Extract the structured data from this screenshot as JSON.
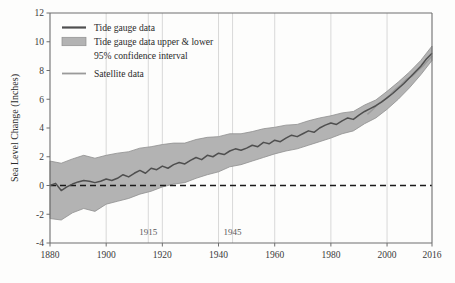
{
  "chart_data": {
    "type": "line",
    "title": "",
    "subtitle": "",
    "xlabel": "",
    "ylabel": "Sea Level Change (Inches)",
    "xlim": [
      1880,
      2016
    ],
    "ylim": [
      -4,
      12
    ],
    "grid": "vertical-only",
    "x_ticks": [
      "1880",
      "1900",
      "1920",
      "1940",
      "1960",
      "1980",
      "2000",
      "2016"
    ],
    "x_tick_values": [
      1880,
      1900,
      1920,
      1940,
      1960,
      1980,
      2000,
      2016
    ],
    "y_ticks": [
      "-4",
      "-2",
      "0",
      "2",
      "4",
      "6",
      "8",
      "10",
      "12"
    ],
    "y_tick_values": [
      -4,
      -2,
      0,
      2,
      4,
      6,
      8,
      10,
      12
    ],
    "inner_gridline_labels": [
      "1915",
      "1945"
    ],
    "inner_gridline_values": [
      1915,
      1945
    ],
    "zero_reference_line": 0,
    "legend_position": "top-left-inside",
    "legend": [
      {
        "label": "Tide gauge data",
        "marker": "line",
        "color": "#4f4f4f"
      },
      {
        "label": "Tide gauge data upper & lower",
        "marker": "band",
        "color": "#b3b3b3"
      },
      {
        "label": "95% confidence interval",
        "marker": "none",
        "color": "#b3b3b3"
      },
      {
        "label": "Satellite data",
        "marker": "line",
        "color": "#9a9a9a"
      }
    ],
    "series": [
      {
        "name": "Tide gauge data",
        "x": [
          1880,
          1882,
          1884,
          1886,
          1888,
          1890,
          1892,
          1894,
          1896,
          1898,
          1900,
          1902,
          1904,
          1906,
          1908,
          1910,
          1912,
          1914,
          1916,
          1918,
          1920,
          1922,
          1924,
          1926,
          1928,
          1930,
          1932,
          1934,
          1936,
          1938,
          1940,
          1942,
          1944,
          1946,
          1948,
          1950,
          1952,
          1954,
          1956,
          1958,
          1960,
          1962,
          1964,
          1966,
          1968,
          1970,
          1972,
          1974,
          1976,
          1978,
          1980,
          1982,
          1984,
          1986,
          1988,
          1990,
          1992,
          1994,
          1996,
          1998,
          2000,
          2002,
          2004,
          2006,
          2008,
          2010,
          2012,
          2014,
          2016
        ],
        "values": [
          0.0,
          0.15,
          -0.35,
          -0.1,
          0.1,
          0.25,
          0.35,
          0.3,
          0.2,
          0.3,
          0.45,
          0.35,
          0.5,
          0.75,
          0.6,
          0.85,
          1.05,
          0.85,
          1.2,
          1.1,
          1.35,
          1.2,
          1.45,
          1.6,
          1.5,
          1.75,
          1.95,
          1.8,
          2.1,
          2.0,
          2.25,
          2.15,
          2.4,
          2.55,
          2.45,
          2.6,
          2.8,
          2.7,
          3.0,
          2.9,
          3.15,
          3.05,
          3.3,
          3.5,
          3.4,
          3.6,
          3.8,
          3.7,
          4.0,
          4.2,
          4.35,
          4.25,
          4.5,
          4.7,
          4.6,
          4.9,
          5.15,
          5.35,
          5.55,
          5.8,
          6.1,
          6.4,
          6.75,
          7.1,
          7.5,
          7.9,
          8.3,
          8.8,
          9.2
        ]
      },
      {
        "name": "Tide gauge data upper & lower 95% confidence interval (upper)",
        "x": [
          1880,
          1884,
          1888,
          1892,
          1896,
          1900,
          1904,
          1908,
          1912,
          1916,
          1920,
          1924,
          1928,
          1932,
          1936,
          1940,
          1944,
          1948,
          1952,
          1956,
          1960,
          1964,
          1968,
          1972,
          1976,
          1980,
          1984,
          1988,
          1992,
          1996,
          2000,
          2004,
          2008,
          2012,
          2016
        ],
        "values": [
          1.7,
          1.55,
          1.85,
          2.1,
          1.9,
          2.1,
          2.25,
          2.35,
          2.6,
          2.7,
          2.85,
          2.95,
          2.95,
          3.2,
          3.35,
          3.4,
          3.6,
          3.6,
          3.75,
          3.95,
          4.05,
          4.2,
          4.25,
          4.5,
          4.7,
          4.85,
          5.05,
          5.15,
          5.6,
          5.95,
          6.55,
          7.2,
          7.9,
          8.7,
          9.7
        ]
      },
      {
        "name": "Tide gauge data upper & lower 95% confidence interval (lower)",
        "x": [
          1880,
          1884,
          1888,
          1892,
          1896,
          1900,
          1904,
          1908,
          1912,
          1916,
          1920,
          1924,
          1928,
          1932,
          1936,
          1940,
          1944,
          1948,
          1952,
          1956,
          1960,
          1964,
          1968,
          1972,
          1976,
          1980,
          1984,
          1988,
          1992,
          1996,
          2000,
          2004,
          2008,
          2012,
          2016
        ],
        "values": [
          -2.3,
          -2.4,
          -1.9,
          -1.6,
          -1.8,
          -1.3,
          -1.1,
          -0.9,
          -0.6,
          -0.4,
          -0.1,
          0.1,
          0.2,
          0.5,
          0.75,
          0.95,
          1.3,
          1.45,
          1.7,
          1.95,
          2.2,
          2.4,
          2.55,
          2.8,
          3.05,
          3.3,
          3.6,
          3.8,
          4.3,
          4.7,
          5.3,
          6.0,
          6.8,
          7.7,
          8.7
        ]
      },
      {
        "name": "Satellite data",
        "x": [
          1993,
          1995,
          1997,
          1999,
          2001,
          2003,
          2005,
          2007,
          2009,
          2011,
          2013,
          2015,
          2016
        ],
        "values": [
          4.95,
          5.3,
          5.7,
          5.95,
          6.3,
          6.7,
          7.0,
          7.4,
          7.6,
          8.0,
          8.35,
          8.8,
          9.0
        ]
      }
    ]
  },
  "colors": {
    "band": "#b3b3b3",
    "band_edge": "#8f8f8f",
    "tide_line": "#4f4f4f",
    "satellite_line": "#9a9a9a",
    "zero_line": "#1a1a1a",
    "frame": "#6e6e6e",
    "gridline": "#c9c9c9",
    "text": "#2b2b2b",
    "background": "#fdfdfc"
  }
}
